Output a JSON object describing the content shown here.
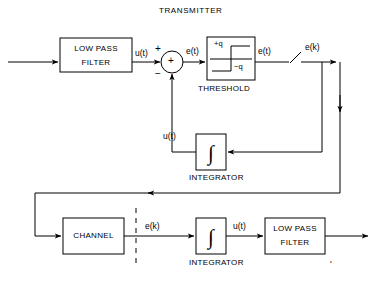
{
  "diagram": {
    "title": "TRANSMITTER",
    "type": "delta-modulation-block-diagram",
    "stroke_color": "#000000",
    "background_color": "#ffffff"
  },
  "blocks": {
    "tx_lowpass": {
      "line1": "LOW PASS",
      "line2": "FILTER",
      "name": "low-pass-filter-transmitter"
    },
    "threshold": {
      "caption": "THRESHOLD",
      "plus_q": "+q",
      "minus_q": "−q",
      "name": "threshold-block"
    },
    "tx_integrator": {
      "symbol": "∫",
      "caption": "INTEGRATOR",
      "name": "integrator-transmitter"
    },
    "channel": {
      "label": "CHANNEL",
      "name": "channel-block"
    },
    "rx_integrator": {
      "symbol": "∫",
      "caption": "INTEGRATOR",
      "name": "integrator-receiver"
    },
    "rx_lowpass": {
      "line1": "LOW PASS",
      "line2": "FILTER",
      "name": "low-pass-filter-receiver"
    }
  },
  "summing_junction": {
    "symbol": "+",
    "plus_sign": "+",
    "minus_sign": "−",
    "name": "summing-junction"
  },
  "signals": {
    "u_t": {
      "base": "u(t)",
      "text": "u(t)"
    },
    "e_t": {
      "base": "e(t)",
      "text": "e(t)"
    },
    "e_prime_t": {
      "base": "e",
      "dot": "'",
      "rest": "(t)",
      "text": "e'(t)"
    },
    "e_prime_k_tx": {
      "base": "e",
      "dot": "'",
      "rest": "(k)",
      "text": "e'(k)"
    },
    "u_prime_t_tx": {
      "base": "u",
      "dot": "'",
      "rest": "(t)",
      "text": "u'(t)"
    },
    "e_prime_k_rx": {
      "base": "e",
      "dot": "'",
      "rest": "(k)",
      "text": "e'(k)"
    },
    "u_prime_t_rx": {
      "base": "u",
      "dot": "'",
      "rest": "(t)",
      "text": "u'(t)"
    }
  },
  "elements": {
    "sampler_switch": "sampler-switch",
    "dashed_divider": "dashed-divider",
    "input_arrow": "input-signal-arrow",
    "output_arrow": "output-signal-arrow"
  }
}
